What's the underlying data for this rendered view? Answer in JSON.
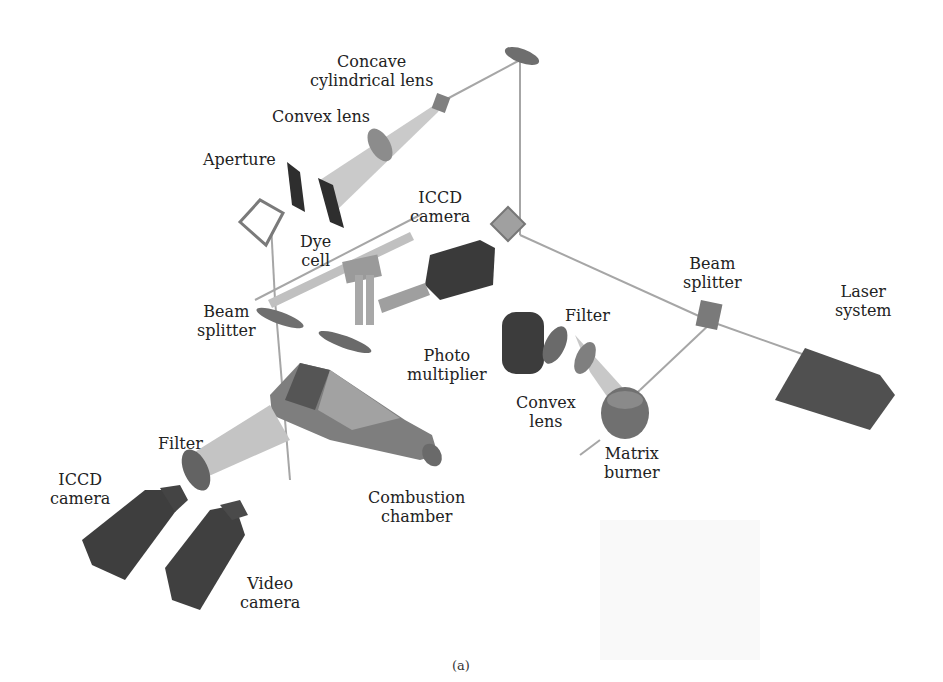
{
  "figure": {
    "caption": "(a)",
    "colors": {
      "background": "#ffffff",
      "beam": "#a8a8a8",
      "component_dark": "#4a4a4a",
      "component_mid": "#7a7a7a",
      "component_light": "#b8b8b8",
      "label_text": "#222222"
    }
  },
  "labels": {
    "concave_cylindrical_lens": "Concave\ncylindrical lens",
    "convex_lens_top": "Convex lens",
    "aperture": "Aperture",
    "icdd_camera_top": "ICCD\ncamera",
    "dye_cell": "Dye\ncell",
    "beam_splitter_left": "Beam\nsplitter",
    "beam_splitter_right": "Beam\nsplitter",
    "laser_system": "Laser\nsystem",
    "filter_right": "Filter",
    "photo_multiplier": "Photo\nmultiplier",
    "convex_lens_right": "Convex\nlens",
    "matrix_burner": "Matrix\nburner",
    "filter_left": "Filter",
    "icdd_camera_left": "ICCD\ncamera",
    "combustion_chamber": "Combustion\nchamber",
    "video_camera": "Video\ncamera"
  }
}
